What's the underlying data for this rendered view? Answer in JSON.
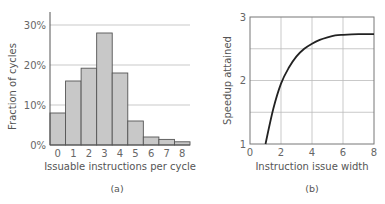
{
  "chart_data": [
    {
      "type": "bar",
      "caption": "(a)",
      "title": "",
      "xlabel": "Issuable instructions per cycle",
      "ylabel": "Fraction of cycles",
      "categories": [
        "0",
        "1",
        "2",
        "3",
        "4",
        "5",
        "6",
        "7",
        "8"
      ],
      "values": [
        8,
        16,
        19.2,
        28,
        18,
        6,
        2,
        1.4,
        0.8
      ],
      "value_unit": "%",
      "ylim": [
        0,
        33
      ],
      "yticks": [
        0,
        10,
        20,
        30
      ],
      "ytick_labels": [
        "0%",
        "10%",
        "20%",
        "30%"
      ],
      "grid": "horizontal",
      "bar_color": "#c8c8c8",
      "bar_edge_color": "#555555"
    },
    {
      "type": "line",
      "caption": "(b)",
      "title": "",
      "xlabel": "Instruction issue width",
      "ylabel": "Speedup attained",
      "x": [
        1,
        1.5,
        2,
        2.5,
        3,
        3.5,
        4,
        4.5,
        5,
        5.5,
        6,
        7,
        8
      ],
      "y": [
        1.0,
        1.55,
        1.95,
        2.2,
        2.38,
        2.5,
        2.58,
        2.64,
        2.68,
        2.71,
        2.72,
        2.73,
        2.73
      ],
      "xlim": [
        0,
        8
      ],
      "ylim": [
        1,
        3
      ],
      "xticks": [
        0,
        2,
        4,
        6,
        8
      ],
      "xtick_labels": [
        "0",
        "2",
        "4",
        "6",
        "8"
      ],
      "yticks": [
        1,
        2,
        3
      ],
      "ytick_labels": [
        "1",
        "2",
        "3"
      ],
      "grid": "both",
      "line_color": "#222222"
    }
  ]
}
